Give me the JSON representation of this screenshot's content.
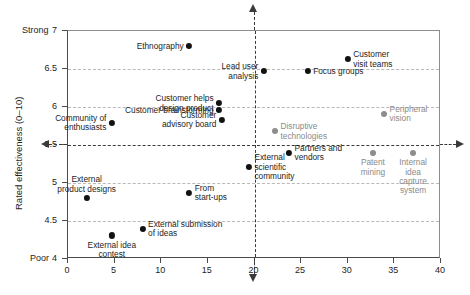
{
  "chart_data": {
    "type": "scatter",
    "title": "",
    "xlabel": "",
    "ylabel": "Rated effectiveness (0–10)",
    "xlim": [
      0,
      40
    ],
    "ylim": [
      4,
      7
    ],
    "grid": true,
    "legend": "none",
    "x_ticks": [
      "0",
      "5",
      "10",
      "15",
      "20",
      "25",
      "30",
      "35",
      "40"
    ],
    "x_tick_values": [
      0,
      5,
      10,
      15,
      20,
      25,
      30,
      35,
      40
    ],
    "y_ticks": [
      "4",
      "4.5",
      "5",
      "5.5",
      "6",
      "6.5",
      "7"
    ],
    "y_tick_values": [
      4,
      4.5,
      5,
      5.5,
      6,
      6.5,
      7
    ],
    "y_axis_top_label": "Strong",
    "y_axis_bottom_label": "Poor",
    "reference_lines": {
      "horizontal": 5.5,
      "vertical": 20
    },
    "points": [
      {
        "label": "Ethnography",
        "x": 13.0,
        "y": 6.8,
        "color": "#121212",
        "style": "dark",
        "label_pos": "left",
        "label_lines": [
          "Ethnography"
        ]
      },
      {
        "label": "Customer visit teams",
        "x": 30.0,
        "y": 6.63,
        "color": "#121212",
        "style": "dark",
        "label_pos": "right",
        "label_lines": [
          "Customer",
          "visit teams"
        ]
      },
      {
        "label": "Focus groups",
        "x": 25.7,
        "y": 6.47,
        "color": "#121212",
        "style": "dark",
        "label_pos": "right",
        "label_lines": [
          "Focus groups"
        ]
      },
      {
        "label": "Lead user analysis",
        "x": 21.0,
        "y": 6.47,
        "color": "#121212",
        "style": "dark",
        "label_pos": "left",
        "label_lines": [
          "Lead user",
          "analysis"
        ]
      },
      {
        "label": "Customer helps design product",
        "x": 16.2,
        "y": 6.05,
        "color": "#121212",
        "style": "dark",
        "label_pos": "left",
        "label_lines": [
          "Customer helps",
          "design product"
        ]
      },
      {
        "label": "Customer brainstorming",
        "x": 16.2,
        "y": 5.96,
        "color": "#121212",
        "style": "dark",
        "label_pos": "left",
        "label_lines": [
          "Customer brainstorming"
        ]
      },
      {
        "label": "Customer advisory board",
        "x": 16.5,
        "y": 5.83,
        "color": "#121212",
        "style": "dark",
        "label_pos": "left",
        "label_lines": [
          "Customer",
          "advisory board"
        ]
      },
      {
        "label": "Peripheral vision",
        "x": 33.9,
        "y": 5.91,
        "color": "#8d8d8d",
        "style": "gray",
        "label_pos": "right",
        "label_lines": [
          "Peripheral",
          "vision"
        ]
      },
      {
        "label": "Community of enthusiasts",
        "x": 4.7,
        "y": 5.79,
        "color": "#121212",
        "style": "dark",
        "label_pos": "left",
        "label_lines": [
          "Community of",
          "enthusiasts"
        ]
      },
      {
        "label": "Disruptive technologies",
        "x": 22.2,
        "y": 5.68,
        "color": "#8d8d8d",
        "style": "gray",
        "label_pos": "right",
        "label_lines": [
          "Disruptive",
          "technologies"
        ]
      },
      {
        "label": "Partners and vendors",
        "x": 23.7,
        "y": 5.4,
        "color": "#121212",
        "style": "dark",
        "label_pos": "right",
        "label_lines": [
          "Partners and",
          "vendors"
        ]
      },
      {
        "label": "Patent mining",
        "x": 32.7,
        "y": 5.4,
        "color": "#8d8d8d",
        "style": "gray",
        "label_pos": "below",
        "label_lines": [
          "Patent",
          "mining"
        ]
      },
      {
        "label": "Internal idea capture system",
        "x": 37.0,
        "y": 5.4,
        "color": "#8d8d8d",
        "style": "gray",
        "label_pos": "below",
        "label_lines": [
          "Internal",
          "idea",
          "capture",
          "system"
        ]
      },
      {
        "label": "External scientific community",
        "x": 19.4,
        "y": 5.21,
        "color": "#121212",
        "style": "dark",
        "label_pos": "right",
        "label_lines": [
          "External",
          "scientific",
          "community"
        ]
      },
      {
        "label": "From start-ups",
        "x": 13.0,
        "y": 4.87,
        "color": "#121212",
        "style": "dark",
        "label_pos": "right",
        "label_lines": [
          "From",
          "start-ups"
        ]
      },
      {
        "label": "External product designs",
        "x": 2.0,
        "y": 4.8,
        "color": "#121212",
        "style": "dark",
        "label_pos": "above",
        "label_lines": [
          "External",
          "product designs"
        ]
      },
      {
        "label": "External submission of ideas",
        "x": 8.0,
        "y": 4.4,
        "color": "#121212",
        "style": "dark",
        "label_pos": "right",
        "label_lines": [
          "External submission",
          "of ideas"
        ]
      },
      {
        "label": "External idea contest",
        "x": 4.7,
        "y": 4.31,
        "color": "#121212",
        "style": "dark",
        "label_pos": "below",
        "label_lines": [
          "External idea",
          "contest"
        ]
      }
    ]
  },
  "colors": {
    "dark_point": "#121212",
    "gray_point": "#8d8d8d",
    "axis": "#4a4a4a",
    "grid": "#b9b9b9",
    "reference_line": "#3a3a3a",
    "background": "#ffffff"
  }
}
